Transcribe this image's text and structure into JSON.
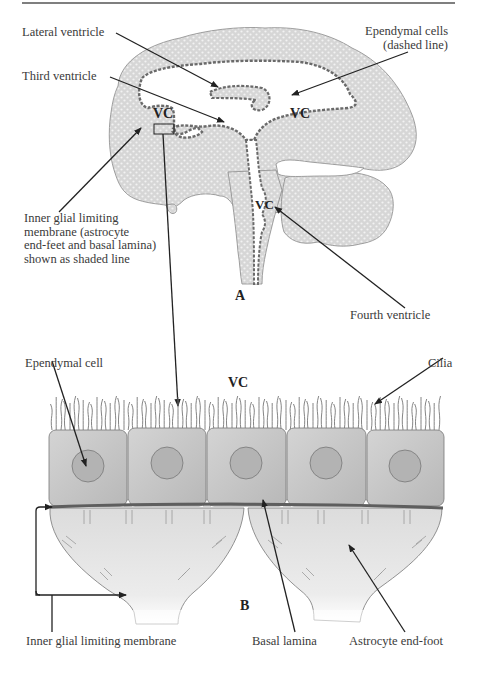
{
  "figure": {
    "panel_a": {
      "label": "A",
      "vc_labels": [
        "VC",
        "VC",
        "VC"
      ],
      "annotations": {
        "lateral_ventricle": "Lateral ventricle",
        "third_ventricle": "Third ventricle",
        "ependymal_cells": [
          "Ependymal cells",
          "(dashed line)"
        ],
        "inner_glial": [
          "Inner glial limiting",
          "membrane (astrocyte",
          "end-feet and basal lamina)",
          "shown as shaded line"
        ],
        "fourth_ventricle": "Fourth ventricle"
      }
    },
    "panel_b": {
      "label": "B",
      "vc_label": "VC",
      "annotations": {
        "ependymal_cell": "Ependymal cell",
        "cilia": "Cilia",
        "inner_glial": "Inner glial limiting membrane",
        "basal_lamina": "Basal lamina",
        "astrocyte_end_foot": "Astrocyte end-foot"
      },
      "cell_count": 5
    },
    "colors": {
      "tissue_fill": "#d9d9d9",
      "tissue_dot": "#f4f4f4",
      "outline": "#7a7a7a",
      "dashed_lining": "#6e6e6e",
      "cell_fill": "#c6c6c6",
      "nucleus_fill": "#b4b4b4",
      "endfoot_fill": "#e6e6e6",
      "basal_lamina": "#666666",
      "arrow": "#222222"
    }
  }
}
